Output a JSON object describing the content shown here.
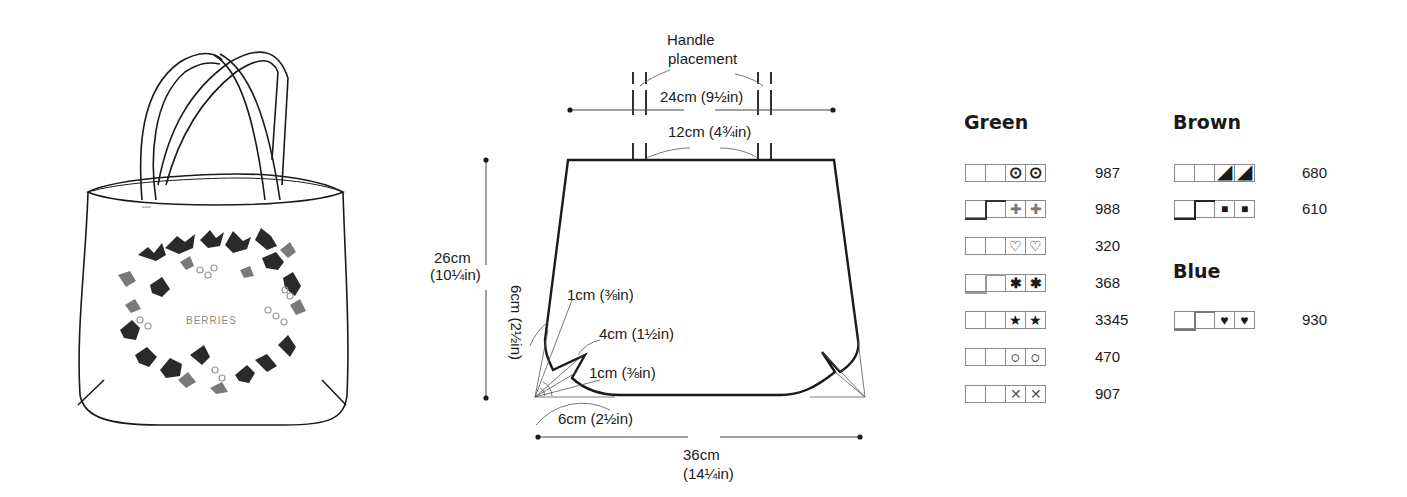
{
  "illustration": {
    "bag_text": "BERRIES"
  },
  "diagram": {
    "handle_label_line1": "Handle",
    "handle_label_line2": "placement",
    "handle_outer_width": "24cm (9½in)",
    "handle_inner_width": "12cm (4¾in)",
    "height_cm": "26cm",
    "height_in": "(10¼in)",
    "corner_side": "6cm (2½in)",
    "corner_bottom": "6cm (2½in)",
    "dart_tip_top": "1cm  (⅜in)",
    "dart_length": "4cm (1½in)",
    "dart_tip_bottom": "1cm (⅜in)",
    "width_cm": "36cm",
    "width_in": "(14¼in)"
  },
  "key": {
    "green": {
      "title": "Green",
      "rows": [
        {
          "symbol": "⊙",
          "symbol_name": "dotted-circle",
          "code": "987",
          "backstitch": false
        },
        {
          "symbol": "✚",
          "symbol_name": "outlined-cross",
          "code": "988",
          "backstitch": true
        },
        {
          "symbol": "♡",
          "symbol_name": "outlined-heart",
          "code": "320",
          "backstitch": false
        },
        {
          "symbol": "✱",
          "symbol_name": "asterisk",
          "code": "368",
          "backstitch": true
        },
        {
          "symbol": "★",
          "symbol_name": "filled-star",
          "code": "3345",
          "backstitch": false
        },
        {
          "symbol": "○",
          "symbol_name": "open-circle",
          "code": "470",
          "backstitch": false
        },
        {
          "symbol": "✕",
          "symbol_name": "x-mark",
          "code": "907",
          "backstitch": false
        }
      ]
    },
    "brown": {
      "title": "Brown",
      "rows": [
        {
          "symbol": "◢",
          "symbol_name": "half-triangle",
          "code": "680",
          "backstitch": false
        },
        {
          "symbol": "■",
          "symbol_name": "filled-square",
          "code": "610",
          "backstitch": true
        }
      ]
    },
    "blue": {
      "title": "Blue",
      "rows": [
        {
          "symbol": "♥",
          "symbol_name": "filled-heart",
          "code": "930",
          "backstitch": true
        }
      ]
    }
  }
}
